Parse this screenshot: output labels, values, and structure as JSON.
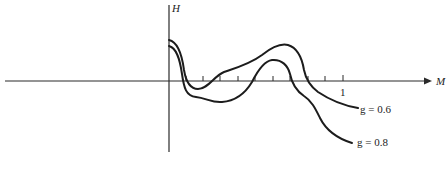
{
  "diagram": {
    "axes": {
      "x_label": "M",
      "y_label": "H",
      "x_tick_label": "1"
    },
    "curves": [
      {
        "name": "g = 0.6",
        "label": "g = 0.6"
      },
      {
        "name": "g = 0.8",
        "label": "g = 0.8"
      }
    ]
  }
}
